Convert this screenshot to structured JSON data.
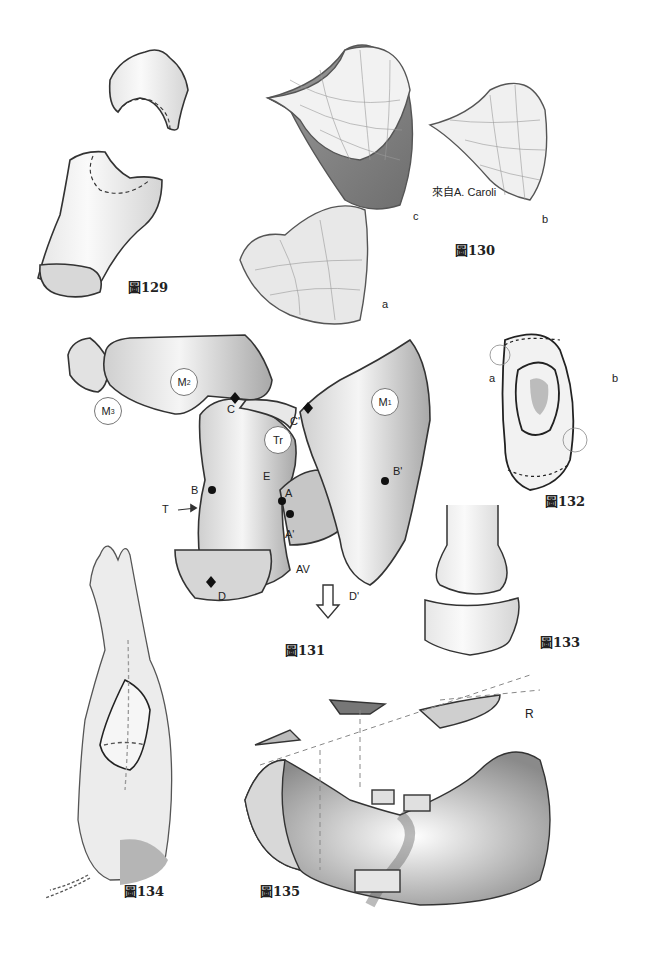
{
  "page": {
    "background": "#ffffff",
    "ink_color": "#222222",
    "shade_color": "#bdbdbd"
  },
  "figures": {
    "fig129": {
      "caption": "圖129"
    },
    "fig130": {
      "caption": "圖130",
      "credit": "來自A. Caroli",
      "labels": {
        "a": "a",
        "b": "b",
        "c": "c"
      }
    },
    "fig131": {
      "caption": "圖131",
      "circles": {
        "m1": "M",
        "m1_sub": "1",
        "m2": "M",
        "m2_sub": "2",
        "m3": "M",
        "m3_sub": "3",
        "tr": "Tr"
      },
      "labels": {
        "C": "C",
        "C_prime": "C'",
        "B": "B",
        "B_prime": "B'",
        "E": "E",
        "A": "A",
        "A_prime": "A'",
        "T": "T",
        "AV": "AV",
        "D": "D",
        "D_prime": "D'"
      }
    },
    "fig132": {
      "caption": "圖132",
      "labels": {
        "a": "a",
        "b": "b"
      }
    },
    "fig133": {
      "caption": "圖133"
    },
    "fig134": {
      "caption": "圖134"
    },
    "fig135": {
      "caption": "圖135",
      "labels": {
        "R": "R"
      }
    }
  }
}
